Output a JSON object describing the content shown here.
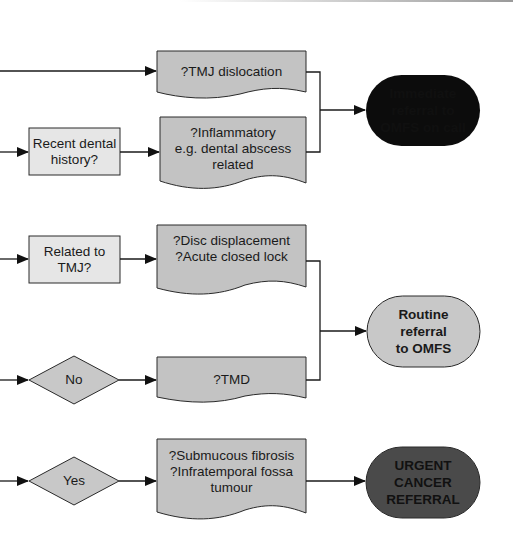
{
  "flowchart": {
    "group1": {
      "decision_recent_dental": "Recent dental\nhistory?",
      "doc_tmj_dislocation": "?TMJ dislocation",
      "doc_inflammatory": "?Inflammatory\ne.g. dental abscess\nrelated",
      "terminal_immediate": "Immediate\nreferral to\nOMFS on call"
    },
    "group2": {
      "decision_related_tmj": "Related to\nTMJ?",
      "diamond_no": "No",
      "doc_disc": "?Disc displacement\n?Acute closed lock",
      "doc_tmd": "?TMD",
      "terminal_routine": "Routine\nreferral\nto OMFS"
    },
    "group3": {
      "diamond_yes": "Yes",
      "doc_submucous": "?Submucous fibrosis\n?Infratemporal fossa\ntumour",
      "terminal_urgent": "URGENT\nCANCER\nREFERRAL"
    }
  },
  "colors": {
    "document_fill": "#c3c3c3",
    "process_fill": "#e6e6e6",
    "diamond_fill": "#c8c8c8",
    "terminal_immediate_fill": "#0c0c0c",
    "terminal_routine_fill": "#c8c8c8",
    "terminal_urgent_fill": "#4a4a4a",
    "line": "#1a1a1a"
  }
}
